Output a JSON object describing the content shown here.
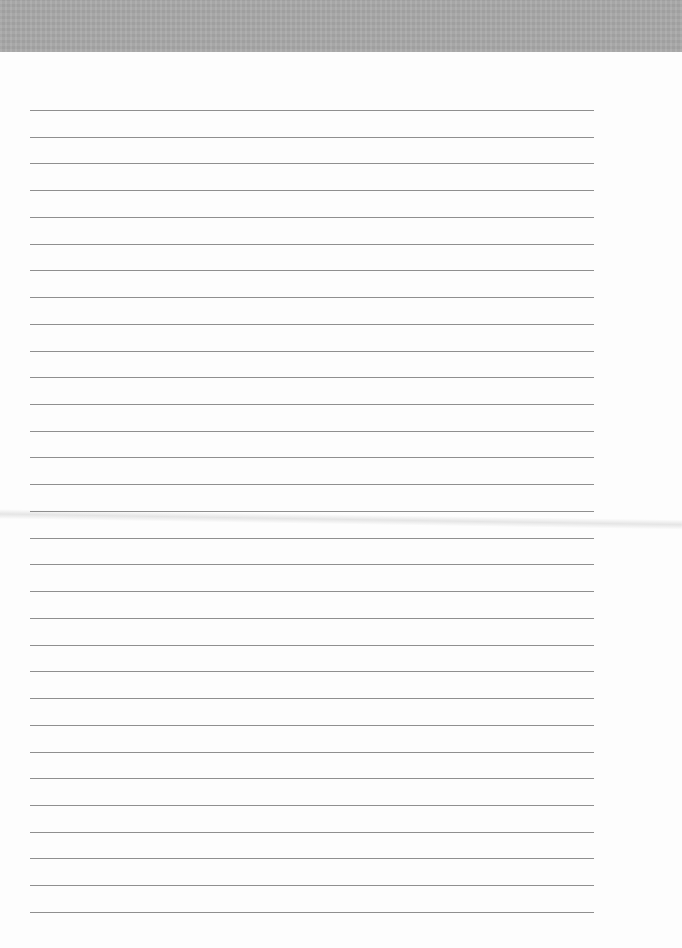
{
  "page": {
    "type": "blank lined paper",
    "top_band_color": "#a9a9a9",
    "paper_color": "#fdfdfd",
    "rule_color": "#8f8f8f",
    "rule_count": 31,
    "first_rule_y": 110,
    "rule_spacing": 26.73,
    "rule_left": 30,
    "rule_right": 594
  }
}
